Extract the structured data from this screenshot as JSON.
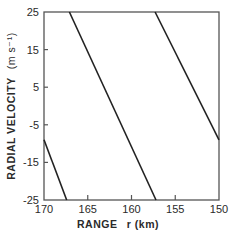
{
  "chart_data": {
    "type": "line",
    "title": "",
    "xlabel": "RANGE  r (km)",
    "ylabel": "RADIAL VELOCITY  (m s⁻¹)",
    "xlim": [
      170,
      150
    ],
    "ylim": [
      -25,
      25
    ],
    "x_reversed": true,
    "xticks": [
      170,
      165,
      160,
      155,
      150
    ],
    "yticks": [
      25,
      15,
      5,
      -5,
      -15,
      -25
    ],
    "grid": false,
    "legend": null,
    "series": [
      {
        "name": "line-1",
        "x": [
          167.1,
          157.2
        ],
        "y": [
          25,
          -25
        ]
      },
      {
        "name": "line-2",
        "x": [
          157.3,
          150
        ],
        "y": [
          25,
          -9
        ]
      },
      {
        "name": "line-3",
        "x": [
          170,
          167.4
        ],
        "y": [
          -9,
          -25
        ]
      }
    ],
    "colors": {
      "axis": "#555555",
      "line": "#222222",
      "text": "#2a2a2a"
    }
  },
  "labels": {
    "xaxis_title": "RANGE",
    "xaxis_unit": "r (km)",
    "yaxis_title": "RADIAL VELOCITY",
    "yaxis_unit": "(m s⁻¹)"
  }
}
